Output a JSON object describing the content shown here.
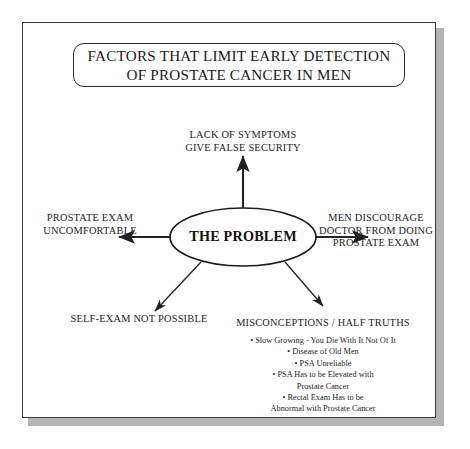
{
  "poster": {
    "title": {
      "line1": "FACTORS THAT LIMIT EARLY DETECTION",
      "line2": "OF PROSTATE CANCER IN MEN"
    },
    "center_node": "THE PROBLEM",
    "branches": {
      "top": {
        "line1": "LACK OF SYMPTOMS",
        "line2": "GIVE FALSE SECURITY"
      },
      "left": {
        "line1": "PROSTATE EXAM",
        "line2": "UNCOMFORTABLE"
      },
      "right": {
        "line1": "MEN DISCOURAGE",
        "line2": "DOCTOR FROM DOING",
        "line3": "PROSTATE EXAM"
      },
      "bottom_left": {
        "line1": "SELF-EXAM NOT POSSIBLE"
      },
      "bottom_right": {
        "heading": "MISCONCEPTIONS / HALF TRUTHS",
        "items": [
          {
            "text": "• Slow Growing - You Die With It Not Of It",
            "cont": ""
          },
          {
            "text": "• Disease of Old Men",
            "cont": ""
          },
          {
            "text": "• PSA Unreliable",
            "cont": ""
          },
          {
            "text": "• PSA Has to be Elevated with",
            "cont": "Prostate Cancer"
          },
          {
            "text": "• Rectal Exam Has to be",
            "cont": "Abnormal with Prostate Cancer"
          }
        ]
      }
    }
  },
  "colors": {
    "ink": "#1d1d1d",
    "frame": "#3a3a3a",
    "shadow": "#b4b4b4",
    "background": "#ffffff"
  }
}
